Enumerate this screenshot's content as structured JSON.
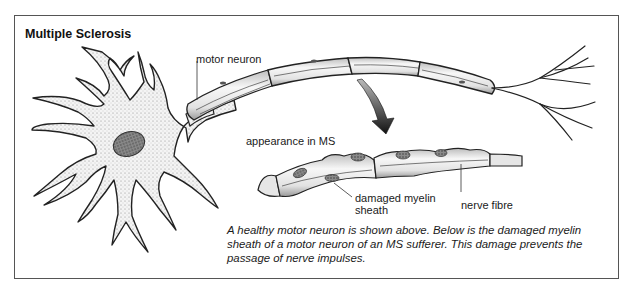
{
  "title": "Multiple Sclerosis",
  "labels": {
    "motor_neuron": "motor neuron",
    "appearance_in_ms": "appearance in MS",
    "damaged_myelin": "damaged myelin",
    "sheath": "sheath",
    "nerve_fibre": "nerve fibre"
  },
  "caption": {
    "line1": "A healthy motor neuron is shown above. Below is the damaged myelin",
    "line2": "sheath of a motor neuron of an MS sufferer. This damage prevents the",
    "line3": "passage of nerve impulses."
  }
}
